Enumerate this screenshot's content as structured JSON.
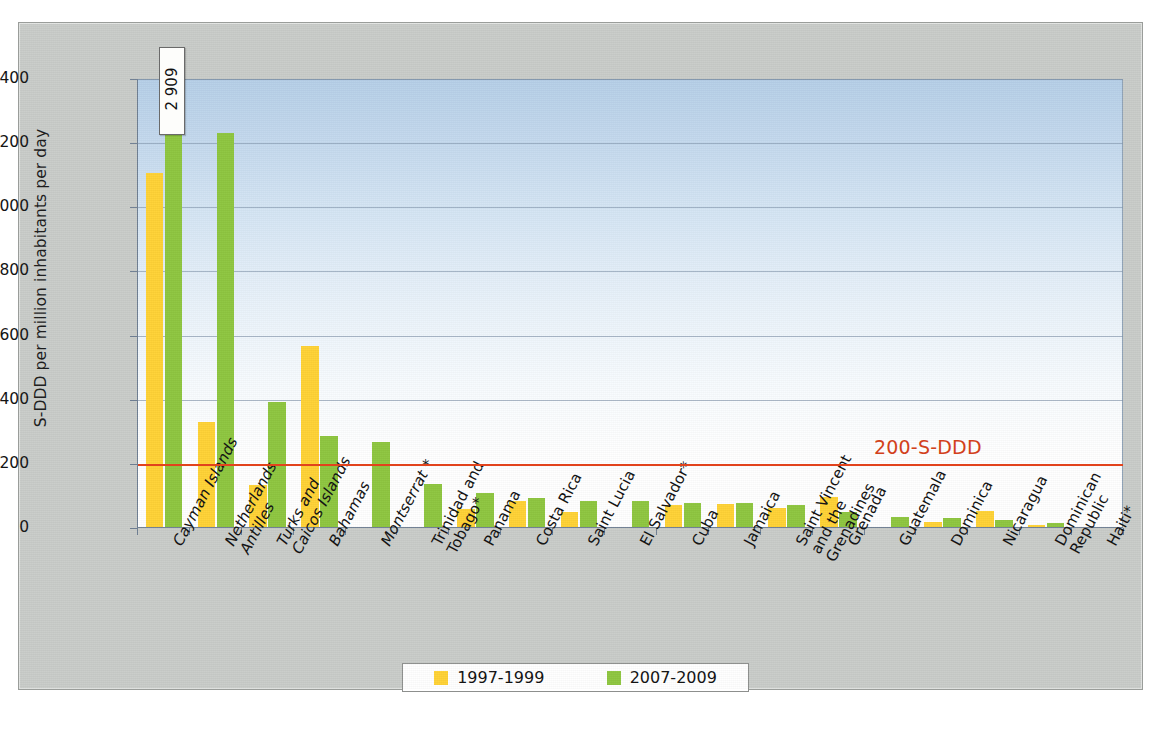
{
  "chart_data": {
    "type": "bar",
    "title": "",
    "xlabel": "",
    "ylabel": "S-DDD per million inhabitants per day",
    "ylim": [
      0,
      1400
    ],
    "ytick_labels": [
      "0",
      "200",
      "400",
      "600",
      "800",
      "1 000",
      "1 200",
      "1 400"
    ],
    "ytick_values": [
      0,
      200,
      400,
      600,
      800,
      1000,
      1200,
      1400
    ],
    "grid": true,
    "legend_position": "bottom",
    "categories": [
      "Cayman Islands",
      "Netherlands Antilles",
      "Turks and Caicos Islands",
      "Bahamas",
      "Montserrat *",
      "Trinidad and Tobago*",
      "Panama",
      "Costa Rica",
      "Saint Lucia",
      "El Salvador*",
      "Cuba",
      "Jamaica",
      "Saint Vincent and the Grenadines",
      "Grenada",
      "Guatemala",
      "Dominica",
      "Nicaragua",
      "Dominican Republic",
      "Haiti*"
    ],
    "series": [
      {
        "name": "1997-1999",
        "color": "#ffd235",
        "values": [
          1105,
          327,
          130,
          565,
          0,
          0,
          57,
          80,
          47,
          0,
          70,
          73,
          58,
          93,
          0,
          15,
          50,
          6,
          0
        ]
      },
      {
        "name": "2007-2009",
        "color": "#8ec63f",
        "values": [
          2909,
          1228,
          390,
          285,
          265,
          133,
          106,
          92,
          81,
          81,
          74,
          74,
          68,
          47,
          31,
          28,
          23,
          11,
          0
        ]
      }
    ],
    "data_labels": [
      {
        "category": "Cayman Islands",
        "series": "2007-2009",
        "text": "2 909",
        "note": "value exceeds axis maximum; shown in callout box"
      }
    ],
    "annotations": [
      {
        "type": "reference-line",
        "value": 200,
        "label": "200-S-DDD",
        "color": "#d2411b"
      }
    ]
  },
  "yaxis": {
    "title": "S-DDD per million inhabitants per day",
    "ticks": [
      {
        "label": "1 400"
      },
      {
        "label": "1 200"
      },
      {
        "label": "1 000"
      },
      {
        "label": "800"
      },
      {
        "label": "600"
      },
      {
        "label": "400"
      },
      {
        "label": "200"
      },
      {
        "label": "0"
      }
    ]
  },
  "xaxis": {
    "labels": [
      {
        "line1": "Cayman Islands",
        "line2": "",
        "italic": true
      },
      {
        "line1": "Netherlands",
        "line2": "Antilles",
        "italic": true
      },
      {
        "line1": "Turks and",
        "line2": "Caicos Islands",
        "italic": true
      },
      {
        "line1": "Bahamas",
        "line2": "",
        "italic": true
      },
      {
        "line1": "Montserrat *",
        "line2": "",
        "italic": true
      },
      {
        "line1": "Trinidad and",
        "line2": "Tobago*",
        "italic": false
      },
      {
        "line1": "Panama",
        "line2": "",
        "italic": false
      },
      {
        "line1": "Costa Rica",
        "line2": "",
        "italic": false
      },
      {
        "line1": "Saint Lucia",
        "line2": "",
        "italic": false
      },
      {
        "line1": "El Salvador*",
        "line2": "",
        "italic": false
      },
      {
        "line1": "Cuba",
        "line2": "",
        "italic": false
      },
      {
        "line1": "Jamaica",
        "line2": "",
        "italic": false
      },
      {
        "line1": "Saint Vincent",
        "line2": "and the",
        "line3": "Grenadines",
        "italic": false
      },
      {
        "line1": "Grenada",
        "line2": "",
        "italic": false
      },
      {
        "line1": "Guatemala",
        "line2": "",
        "italic": false
      },
      {
        "line1": "Dominica",
        "line2": "",
        "italic": false
      },
      {
        "line1": "Nicaragua",
        "line2": "",
        "italic": false
      },
      {
        "line1": "Dominican",
        "line2": "Republic",
        "italic": false
      },
      {
        "line1": "Haiti*",
        "line2": "",
        "italic": false
      }
    ]
  },
  "legend": {
    "items": [
      {
        "label": "1997-1999",
        "color": "#ffd235"
      },
      {
        "label": "2007-2009",
        "color": "#8ec63f"
      }
    ]
  },
  "callout": {
    "value": "2 909"
  },
  "reference": {
    "label": "200-S-DDD"
  },
  "footnote": {
    "text": ""
  }
}
